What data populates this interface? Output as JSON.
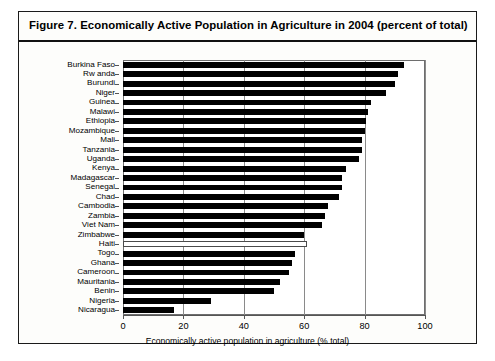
{
  "figure": {
    "title": "Figure 7.  Economically Active Population in Agriculture in 2004 (percent of total)",
    "frame_color": "#1a1a1a",
    "bar_color": "#000000",
    "highlight_bar_color": "#ffffff"
  },
  "chart_data": {
    "type": "bar",
    "orientation": "horizontal",
    "title": "Figure 7.  Economically Active Population in Agriculture in 2004 (percent of total)",
    "xlabel": "Economically active population in agriculture (% total)",
    "ylabel": "",
    "xlim": [
      0,
      100
    ],
    "xticks": [
      0,
      20,
      40,
      60,
      80,
      100
    ],
    "xtick_labels": [
      "0",
      "20",
      "40",
      "60",
      "80",
      "100"
    ],
    "grid": "vertical",
    "legend": "none",
    "categories": [
      "Burkina Faso",
      "Rw anda",
      "Burundi",
      "Niger",
      "Guinea",
      "Malawi",
      "Ethiopia",
      "Mozambique",
      "Mali",
      "Tanzania",
      "Uganda",
      "Kenya",
      "Madagascar",
      "Senegal",
      "Chad",
      "Cambodia",
      "Zambia",
      "Viet Nam",
      "Zimbabwe",
      "Haiti",
      "Togo",
      "Ghana",
      "Cameroon",
      "Mauritania",
      "Benin",
      "Nigeria",
      "Nicaragua"
    ],
    "values": [
      93,
      91,
      90,
      87,
      82,
      81,
      80.5,
      80,
      79,
      79,
      78,
      74,
      72.5,
      72.5,
      71.5,
      68,
      67,
      66,
      60,
      61,
      57,
      56,
      55,
      52,
      50,
      29,
      17
    ],
    "styles": [
      "filled",
      "filled",
      "filled",
      "filled",
      "filled",
      "filled",
      "filled",
      "filled",
      "filled",
      "filled",
      "filled",
      "filled",
      "filled",
      "filled",
      "filled",
      "filled",
      "filled",
      "filled",
      "filled",
      "hollow",
      "filled",
      "filled",
      "filled",
      "filled",
      "filled",
      "filled",
      "filled"
    ]
  }
}
